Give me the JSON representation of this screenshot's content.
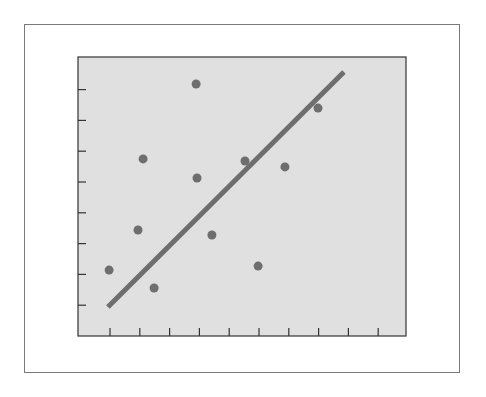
{
  "chart_data": {
    "type": "scatter",
    "title": "",
    "xlabel": "",
    "ylabel": "",
    "xlim": [
      0,
      11
    ],
    "ylim": [
      0,
      9.7
    ],
    "grid": false,
    "legend": null,
    "x_ticks": [
      1,
      2,
      3,
      4,
      5,
      6,
      7,
      8,
      9,
      10
    ],
    "y_ticks": [
      1,
      2,
      3,
      4,
      5,
      6,
      7,
      8
    ],
    "tick_labels_visible": false,
    "series": [
      {
        "name": "points",
        "type": "scatter",
        "x": [
          0.97,
          1.94,
          2.11,
          2.48,
          3.89,
          3.92,
          4.42,
          5.53,
          5.97,
          6.87,
          7.98
        ],
        "y": [
          2.14,
          3.44,
          5.75,
          1.56,
          8.18,
          5.13,
          3.28,
          5.68,
          2.27,
          5.49,
          7.4
        ]
      },
      {
        "name": "trend line",
        "type": "line",
        "x": [
          0.93,
          8.85
        ],
        "y": [
          0.94,
          8.57
        ]
      }
    ],
    "colors": {
      "background": "#ffffff",
      "plot_background": "#e0e0e0",
      "axis": "#333333",
      "points": "#6e6e6e",
      "line": "#6e6e6e",
      "frame": "#7a7a7a"
    }
  }
}
